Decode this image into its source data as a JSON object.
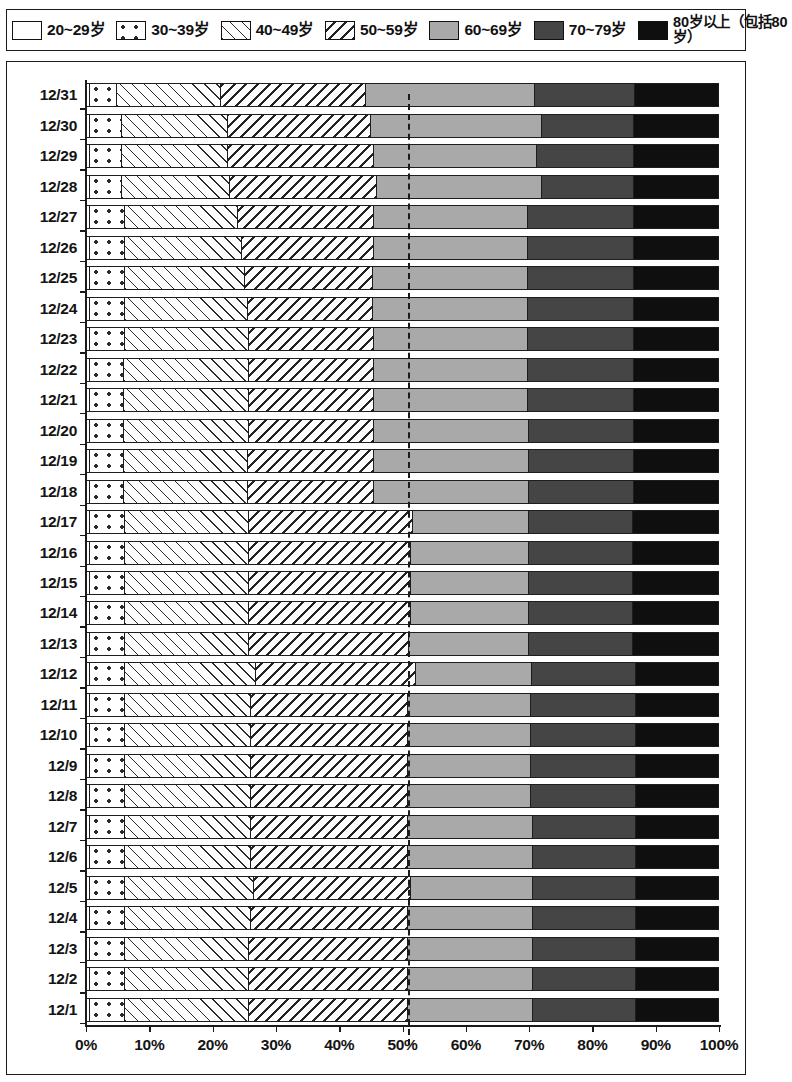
{
  "legend": {
    "items": [
      {
        "label": "20~29岁",
        "key": "20-29",
        "pattern": "empty-white",
        "color": "#ffffff"
      },
      {
        "label": "30~39岁",
        "key": "30-39",
        "pattern": "dotted",
        "color": "#ffffff"
      },
      {
        "label": "40~49岁",
        "key": "40-49",
        "pattern": "forward-hatch",
        "color": "#fdfdfd"
      },
      {
        "label": "50~59岁",
        "key": "50-59",
        "pattern": "backward-hatch",
        "color": "#fdfdfd"
      },
      {
        "label": "60~69岁",
        "key": "60-69",
        "pattern": "solid",
        "color": "#a9a9a9"
      },
      {
        "label": "70~79岁",
        "key": "70-79",
        "pattern": "solid",
        "color": "#454545"
      },
      {
        "label": "80岁以上（包括80岁）",
        "key": "80-up",
        "pattern": "solid",
        "color": "#0f0f0f"
      }
    ]
  },
  "chart_data": {
    "type": "bar",
    "orientation": "horizontal",
    "stacked": true,
    "normalized_percent": true,
    "title": "",
    "xlabel": "",
    "ylabel": "",
    "xlim": [
      0,
      100
    ],
    "xticks": [
      "0%",
      "10%",
      "20%",
      "30%",
      "40%",
      "50%",
      "60%",
      "70%",
      "80%",
      "90%",
      "100%"
    ],
    "xtick_values": [
      0,
      10,
      20,
      30,
      40,
      50,
      60,
      70,
      80,
      90,
      100
    ],
    "grid": false,
    "legend_position": "top",
    "reference_line": {
      "value": 50.8,
      "style": "dashed",
      "color": "#1b1b1b"
    },
    "series": [
      {
        "name": "20~29岁",
        "key": "20-29"
      },
      {
        "name": "30~39岁",
        "key": "30-39"
      },
      {
        "name": "40~49岁",
        "key": "40-49"
      },
      {
        "name": "50~59岁",
        "key": "50-59"
      },
      {
        "name": "60~69岁",
        "key": "60-69"
      },
      {
        "name": "70~79岁",
        "key": "70-79"
      },
      {
        "name": "80岁以上（包括80岁）",
        "key": "80-up"
      }
    ],
    "categories": [
      "12/31",
      "12/30",
      "12/29",
      "12/28",
      "12/27",
      "12/26",
      "12/25",
      "12/24",
      "12/23",
      "12/22",
      "12/21",
      "12/20",
      "12/19",
      "12/18",
      "12/17",
      "12/16",
      "12/15",
      "12/14",
      "12/13",
      "12/12",
      "12/11",
      "12/10",
      "12/9",
      "12/8",
      "12/7",
      "12/6",
      "12/5",
      "12/4",
      "12/3",
      "12/2",
      "12/1"
    ],
    "rows": [
      {
        "category": "12/31",
        "values": [
          0.4,
          4.4,
          16.4,
          23.0,
          26.8,
          15.8,
          13.2
        ]
      },
      {
        "category": "12/30",
        "values": [
          0.4,
          5.1,
          16.9,
          22.6,
          27.1,
          14.6,
          13.3
        ]
      },
      {
        "category": "12/29",
        "values": [
          0.4,
          5.1,
          16.9,
          23.1,
          25.8,
          15.4,
          13.3
        ]
      },
      {
        "category": "12/28",
        "values": [
          0.4,
          5.1,
          17.1,
          23.4,
          26.1,
          14.6,
          13.3
        ]
      },
      {
        "category": "12/27",
        "values": [
          0.4,
          5.6,
          18.0,
          21.5,
          24.4,
          16.8,
          13.3
        ]
      },
      {
        "category": "12/26",
        "values": [
          0.4,
          5.6,
          18.5,
          21.0,
          24.4,
          16.8,
          13.3
        ]
      },
      {
        "category": "12/25",
        "values": [
          0.4,
          5.6,
          19.0,
          20.4,
          24.5,
          16.8,
          13.3
        ]
      },
      {
        "category": "12/24",
        "values": [
          0.4,
          5.6,
          19.5,
          19.9,
          24.5,
          16.8,
          13.3
        ]
      },
      {
        "category": "12/23",
        "values": [
          0.4,
          5.6,
          19.6,
          19.9,
          24.4,
          16.8,
          13.3
        ]
      },
      {
        "category": "12/22",
        "values": [
          0.4,
          5.4,
          19.8,
          19.9,
          24.4,
          16.8,
          13.3
        ]
      },
      {
        "category": "12/21",
        "values": [
          0.4,
          5.4,
          19.8,
          19.9,
          24.4,
          16.8,
          13.3
        ]
      },
      {
        "category": "12/20",
        "values": [
          0.4,
          5.4,
          19.8,
          19.9,
          24.6,
          16.6,
          13.3
        ]
      },
      {
        "category": "12/19",
        "values": [
          0.4,
          5.4,
          19.7,
          20.0,
          24.6,
          16.6,
          13.3
        ]
      },
      {
        "category": "12/18",
        "values": [
          0.4,
          5.4,
          19.7,
          20.0,
          24.6,
          16.6,
          13.3
        ]
      },
      {
        "category": "12/17",
        "values": [
          0.4,
          5.6,
          19.6,
          26.0,
          18.4,
          16.5,
          13.5
        ]
      },
      {
        "category": "12/16",
        "values": [
          0.4,
          5.6,
          19.6,
          25.7,
          18.7,
          16.5,
          13.5
        ]
      },
      {
        "category": "12/15",
        "values": [
          0.4,
          5.6,
          19.6,
          25.7,
          18.7,
          16.5,
          13.5
        ]
      },
      {
        "category": "12/14",
        "values": [
          0.4,
          5.6,
          19.6,
          25.7,
          18.7,
          16.5,
          13.5
        ]
      },
      {
        "category": "12/13",
        "values": [
          0.4,
          5.6,
          19.6,
          25.5,
          18.9,
          16.5,
          13.5
        ]
      },
      {
        "category": "12/12",
        "values": [
          0.4,
          5.6,
          20.8,
          25.4,
          18.4,
          16.4,
          13.0
        ]
      },
      {
        "category": "12/11",
        "values": [
          0.4,
          5.6,
          20.0,
          24.8,
          19.5,
          16.7,
          13.0
        ]
      },
      {
        "category": "12/10",
        "values": [
          0.4,
          5.6,
          20.0,
          24.8,
          19.5,
          16.7,
          13.0
        ]
      },
      {
        "category": "12/9",
        "values": [
          0.4,
          5.6,
          20.0,
          24.8,
          19.5,
          16.7,
          13.0
        ]
      },
      {
        "category": "12/8",
        "values": [
          0.4,
          5.6,
          20.0,
          24.8,
          19.5,
          16.7,
          13.0
        ]
      },
      {
        "category": "12/7",
        "values": [
          0.4,
          5.6,
          20.0,
          24.8,
          19.9,
          16.3,
          13.0
        ]
      },
      {
        "category": "12/6",
        "values": [
          0.4,
          5.6,
          20.0,
          24.8,
          19.9,
          16.3,
          13.0
        ]
      },
      {
        "category": "12/5",
        "values": [
          0.4,
          5.6,
          20.5,
          24.8,
          19.4,
          16.3,
          13.0
        ]
      },
      {
        "category": "12/4",
        "values": [
          0.4,
          5.6,
          20.0,
          24.8,
          19.9,
          16.3,
          13.0
        ]
      },
      {
        "category": "12/3",
        "values": [
          0.4,
          5.6,
          19.7,
          25.1,
          19.9,
          16.3,
          13.0
        ]
      },
      {
        "category": "12/2",
        "values": [
          0.4,
          5.6,
          19.7,
          25.1,
          19.9,
          16.3,
          13.0
        ]
      },
      {
        "category": "12/1",
        "values": [
          0.4,
          5.6,
          19.7,
          25.1,
          19.9,
          16.3,
          13.0
        ]
      }
    ]
  }
}
